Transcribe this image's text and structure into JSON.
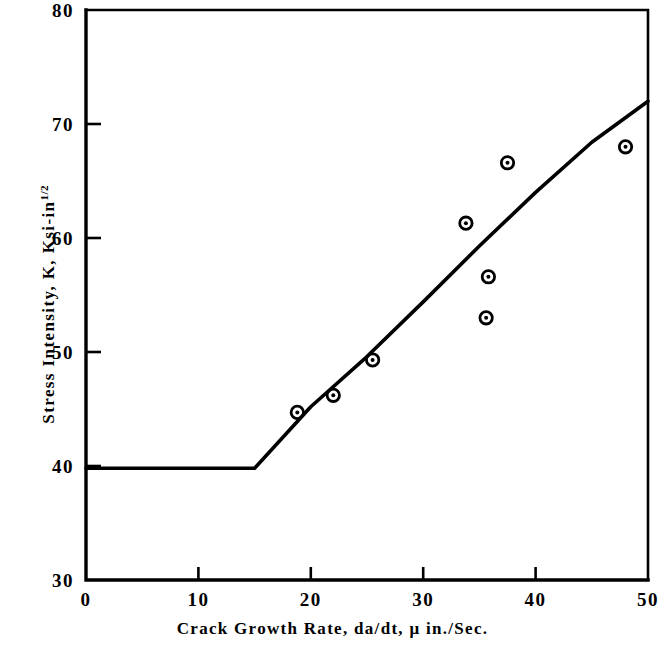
{
  "chart_data": {
    "type": "scatter",
    "title": "",
    "subtitle": "",
    "xlabel": "Crack Growth Rate, da/dt, μ in./Sec.",
    "ylabel": "Stress Intensity, K, Ksi-in",
    "ylabel_superscript": "1/2",
    "xlim": [
      0,
      50
    ],
    "ylim": [
      30,
      80
    ],
    "xticks": [
      0,
      10,
      20,
      30,
      40,
      50
    ],
    "yticks": [
      30,
      40,
      50,
      60,
      70,
      80
    ],
    "xtick_labels": [
      "0",
      "10",
      "20",
      "30",
      "40",
      "50"
    ],
    "ytick_labels": [
      "30",
      "40",
      "50",
      "60",
      "70",
      "80"
    ],
    "grid": false,
    "legend": null,
    "marker_style": "open-circle-with-center-dot",
    "series": [
      {
        "name": "Measured data",
        "type": "scatter",
        "points": [
          {
            "x": 18.8,
            "y": 44.7
          },
          {
            "x": 22.0,
            "y": 46.2
          },
          {
            "x": 25.5,
            "y": 49.3
          },
          {
            "x": 33.8,
            "y": 61.3
          },
          {
            "x": 35.6,
            "y": 53.0
          },
          {
            "x": 35.8,
            "y": 56.6
          },
          {
            "x": 37.5,
            "y": 66.6
          },
          {
            "x": 48.0,
            "y": 68.0
          }
        ]
      },
      {
        "name": "Fitted threshold curve",
        "type": "line",
        "points": [
          {
            "x": 0.0,
            "y": 39.8
          },
          {
            "x": 15.0,
            "y": 39.8
          },
          {
            "x": 20.0,
            "y": 45.2
          },
          {
            "x": 25.0,
            "y": 49.6
          },
          {
            "x": 30.0,
            "y": 54.4
          },
          {
            "x": 35.0,
            "y": 59.3
          },
          {
            "x": 40.0,
            "y": 64.0
          },
          {
            "x": 45.0,
            "y": 68.4
          },
          {
            "x": 50.0,
            "y": 72.0
          }
        ]
      }
    ],
    "annotations": [],
    "colors": {
      "line": "#000000",
      "marker": "#000000",
      "axis": "#000000",
      "background": "#ffffff"
    }
  }
}
